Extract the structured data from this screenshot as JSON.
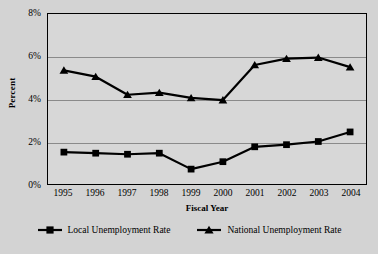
{
  "chart_data": {
    "type": "line",
    "title": "",
    "xlabel": "Fiscal Year",
    "ylabel": "Percent",
    "categories": [
      "1995",
      "1996",
      "1997",
      "1998",
      "1999",
      "2000",
      "2001",
      "2002",
      "2003",
      "2004"
    ],
    "ylim": [
      0,
      8
    ],
    "ytick_labels": [
      "0%",
      "2%",
      "4%",
      "6%",
      "8%"
    ],
    "ytick_values": [
      0,
      2,
      4,
      6,
      8
    ],
    "grid": true,
    "legend_position": "bottom",
    "series": [
      {
        "name": "Local Unemployment Rate",
        "marker": "square",
        "color": "#000000",
        "values": [
          1.5,
          1.45,
          1.4,
          1.45,
          0.7,
          1.05,
          1.75,
          1.85,
          2.0,
          2.45
        ]
      },
      {
        "name": "National Unemployment Rate",
        "marker": "triangle",
        "color": "#000000",
        "values": [
          5.35,
          5.05,
          4.2,
          4.3,
          4.05,
          3.95,
          5.6,
          5.9,
          5.95,
          5.5
        ]
      }
    ]
  },
  "colors": {
    "figure_background": "#d3d3d3",
    "plot_background": "#d7d7d7",
    "gridline": "#8a8a8a",
    "axis": "#000000",
    "series": "#000000"
  }
}
